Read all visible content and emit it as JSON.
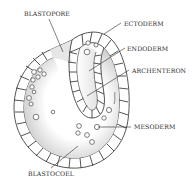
{
  "diagram": {
    "labels": [
      {
        "id": "blastopore",
        "text": "BLASTOPORE",
        "x": 24,
        "y": 11
      },
      {
        "id": "ectoderm",
        "text": "ECTODERM",
        "x": 124,
        "y": 21
      },
      {
        "id": "endoderm",
        "text": "ENDODERM",
        "x": 127,
        "y": 46
      },
      {
        "id": "archenteron",
        "text": "ARCHENTERON",
        "x": 132,
        "y": 68
      },
      {
        "id": "mesoderm",
        "text": "MESODERM",
        "x": 134,
        "y": 124
      },
      {
        "id": "blastocoel",
        "text": "BLASTOCOEL",
        "x": 28,
        "y": 171
      }
    ],
    "colors": {
      "line": "#2a2a2a",
      "background": "#ffffff",
      "shade": "#bdbdbd"
    }
  }
}
